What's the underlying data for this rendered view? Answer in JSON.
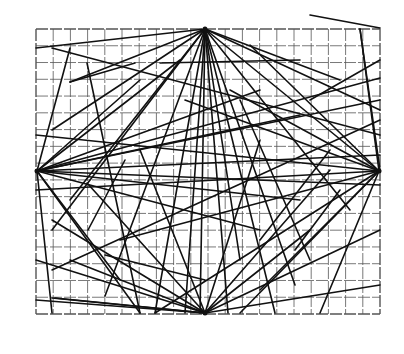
{
  "figure": {
    "title": "",
    "background": "#ffffff",
    "line_color": "#111111",
    "grid_color": "#555555",
    "grid": {
      "x0": 36,
      "y0": 29,
      "x1": 380,
      "y1": 314,
      "cols": 20,
      "rows": 17
    },
    "hubs": [
      {
        "name": "top",
        "x": 205,
        "y": 29
      },
      {
        "name": "left",
        "x": 37,
        "y": 171
      },
      {
        "name": "right",
        "x": 379,
        "y": 171
      },
      {
        "name": "bottom",
        "x": 205,
        "y": 313
      }
    ],
    "segments": [
      [
        205,
        29,
        36,
        48
      ],
      [
        205,
        29,
        52,
        130
      ],
      [
        205,
        29,
        52,
        230
      ],
      [
        205,
        29,
        70,
        200
      ],
      [
        205,
        29,
        105,
        296
      ],
      [
        205,
        29,
        155,
        313
      ],
      [
        205,
        29,
        185,
        313
      ],
      [
        205,
        29,
        200,
        313
      ],
      [
        205,
        29,
        228,
        313
      ],
      [
        205,
        29,
        240,
        260
      ],
      [
        205,
        29,
        275,
        313
      ],
      [
        205,
        29,
        350,
        210
      ],
      [
        205,
        29,
        380,
        110
      ],
      [
        205,
        29,
        340,
        80
      ],
      [
        205,
        29,
        295,
        285
      ],
      [
        37,
        171,
        70,
        48
      ],
      [
        37,
        171,
        140,
        80
      ],
      [
        37,
        171,
        180,
        60
      ],
      [
        37,
        171,
        260,
        90
      ],
      [
        37,
        171,
        300,
        115
      ],
      [
        37,
        171,
        380,
        78
      ],
      [
        37,
        171,
        380,
        100
      ],
      [
        37,
        171,
        380,
        155
      ],
      [
        37,
        171,
        300,
        200
      ],
      [
        37,
        171,
        260,
        230
      ],
      [
        37,
        171,
        140,
        313
      ],
      [
        37,
        171,
        52,
        313
      ],
      [
        37,
        171,
        120,
        280
      ],
      [
        37,
        171,
        380,
        185
      ],
      [
        379,
        171,
        205,
        29
      ],
      [
        379,
        171,
        250,
        45
      ],
      [
        379,
        171,
        230,
        90
      ],
      [
        379,
        171,
        36,
        135
      ],
      [
        379,
        171,
        36,
        190
      ],
      [
        379,
        171,
        120,
        240
      ],
      [
        379,
        171,
        155,
        313
      ],
      [
        379,
        171,
        240,
        313
      ],
      [
        379,
        171,
        260,
        290
      ],
      [
        379,
        171,
        320,
        313
      ],
      [
        379,
        171,
        360,
        29
      ],
      [
        379,
        171,
        185,
        100
      ],
      [
        205,
        313,
        36,
        260
      ],
      [
        205,
        313,
        70,
        260
      ],
      [
        205,
        313,
        52,
        220
      ],
      [
        205,
        313,
        87,
        183
      ],
      [
        205,
        313,
        140,
        150
      ],
      [
        205,
        313,
        260,
        140
      ],
      [
        205,
        313,
        380,
        230
      ],
      [
        205,
        313,
        380,
        285
      ],
      [
        205,
        313,
        330,
        170
      ],
      [
        205,
        313,
        310,
        230
      ],
      [
        205,
        313,
        36,
        300
      ],
      [
        205,
        313,
        55,
        298
      ],
      [
        52,
        48,
        380,
        135
      ],
      [
        70,
        82,
        205,
        29
      ],
      [
        70,
        82,
        135,
        63
      ],
      [
        87,
        63,
        140,
        313
      ],
      [
        88,
        230,
        125,
        160
      ],
      [
        52,
        270,
        380,
        120
      ],
      [
        105,
        255,
        205,
        280
      ],
      [
        52,
        298,
        205,
        313
      ],
      [
        310,
        15,
        380,
        28
      ],
      [
        360,
        29,
        380,
        170
      ],
      [
        260,
        240,
        330,
        150
      ],
      [
        295,
        250,
        340,
        190
      ],
      [
        160,
        63,
        300,
        60
      ],
      [
        240,
        100,
        310,
        260
      ],
      [
        310,
        100,
        380,
        60
      ]
    ]
  }
}
